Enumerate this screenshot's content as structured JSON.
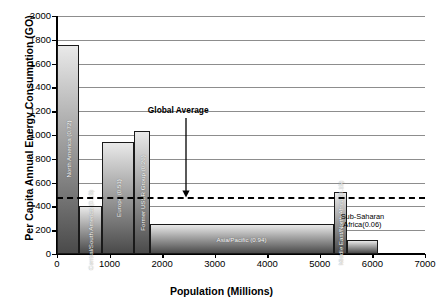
{
  "chart_data": {
    "type": "bar",
    "title": "",
    "subtitle": "",
    "xlabel": "Population (Millions)",
    "ylabel": "Per Capita Annual Energy Consumption (GO)",
    "xlim": [
      0,
      7000
    ],
    "ylim": [
      0,
      2000
    ],
    "xticks": [
      0,
      1000,
      2000,
      3000,
      4000,
      5000,
      6000,
      7000
    ],
    "yticks": [
      0,
      200,
      400,
      600,
      800,
      1000,
      1200,
      1400,
      1600,
      1800,
      2000
    ],
    "grid": "horizontal",
    "legend": "none",
    "variable_width_bars": true,
    "width_units": "Population (Millions)",
    "height_units": "Per Capita Annual Energy Consumption (GO)",
    "categories": [
      "North America",
      "Central/South America",
      "Europe",
      "Former USSR Group",
      "Asia/Pacific",
      "Middle East/North Africa",
      "Sub-Saharan Africa"
    ],
    "values": [
      1760,
      400,
      940,
      1030,
      250,
      520,
      120
    ],
    "widths": [
      420,
      430,
      620,
      290,
      3500,
      250,
      600
    ],
    "x_starts": [
      0,
      420,
      850,
      1470,
      1760,
      5260,
      5510
    ],
    "series": [
      {
        "name": "Per Capita Annual Energy Consumption (GO)",
        "values": [
          1760,
          400,
          940,
          1030,
          250,
          520,
          120
        ]
      }
    ],
    "bars": [
      {
        "label": "North America (0.72)",
        "region": "North America",
        "share": 0.72,
        "population": 420,
        "x_start": 0,
        "value": 1760,
        "label_orientation": "vertical",
        "label_placement": "inside"
      },
      {
        "label": "Central/South America (0.15)",
        "region": "Central/South America",
        "share": 0.15,
        "population": 430,
        "x_start": 420,
        "value": 400,
        "label_orientation": "vertical",
        "label_placement": "inside"
      },
      {
        "label": "Europe (0.51)",
        "region": "Europe",
        "share": 0.51,
        "population": 620,
        "x_start": 850,
        "value": 940,
        "label_orientation": "vertical",
        "label_placement": "inside"
      },
      {
        "label": "Former USSR Group (0.26)",
        "region": "Former USSR Group",
        "share": 0.26,
        "population": 290,
        "x_start": 1470,
        "value": 1030,
        "label_orientation": "vertical",
        "label_placement": "inside"
      },
      {
        "label": "Asia/Pacific (0.94)",
        "region": "Asia/Pacific",
        "share": 0.94,
        "population": 3500,
        "x_start": 1760,
        "value": 250,
        "label_orientation": "horizontal",
        "label_placement": "inside"
      },
      {
        "label": "Middle East/North Africa (0.15)",
        "region": "Middle East/North Africa",
        "share": 0.15,
        "population": 250,
        "x_start": 5260,
        "value": 520,
        "label_orientation": "vertical",
        "label_placement": "inside"
      },
      {
        "label": "Sub-Saharan Africa(0.06)",
        "region": "Sub-Saharan Africa",
        "share": 0.06,
        "population": 600,
        "x_start": 5510,
        "value": 120,
        "label_orientation": "horizontal",
        "label_placement": "outside"
      }
    ],
    "annotations": [
      {
        "text": "Global Average",
        "type": "reference-line-callout",
        "line_style": "dashed",
        "line_value": 480,
        "arrow": "down",
        "arrow_x": 2450
      }
    ],
    "reference_lines": [
      {
        "name": "Global Average",
        "value": 480,
        "style": "dashed",
        "color": "#000000"
      }
    ],
    "colors": {
      "axis": "#000000",
      "grid": "#8d8d8d",
      "bar_outline": "#1a1a1a",
      "bar_light": "#e9e9e9",
      "bar_dark": "#4a4a4a",
      "reference_line": "#000000",
      "label_text": "#ffffff",
      "background": "#ffffff"
    }
  },
  "callouts": {
    "sub_saharan_line1": "Sub-Saharan",
    "sub_saharan_line2": "Africa(0.06)"
  }
}
